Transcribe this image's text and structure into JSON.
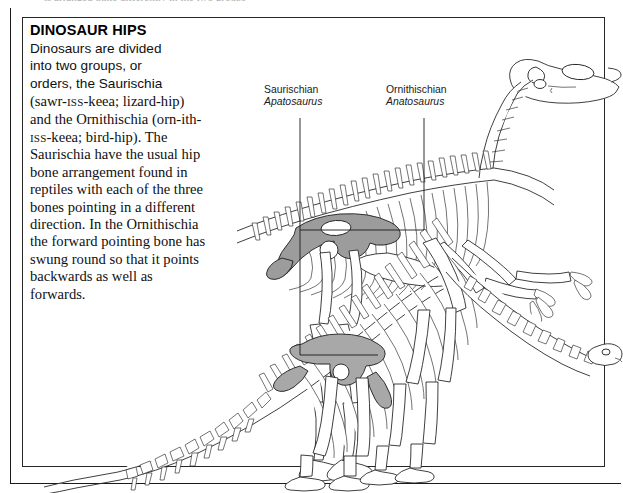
{
  "figure": {
    "clipped_top_line": "is arranged quite differently in the two groups",
    "caption": {
      "title": "DINOSAUR HIPS",
      "sans_lines": [
        "Dinosaurs are divided",
        "into two groups, or",
        "orders, the Saurischia"
      ],
      "serif_paragraph_part1": "(sawr-",
      "serif_smallcaps1": "iss",
      "serif_paragraph_part2": "-keea; lizard-hip) and the Ornithischia (orn-ith-",
      "serif_smallcaps2": "iss",
      "serif_paragraph_part3": "-keea; bird-hip). The Saurischia have the usual hip bone arrangement found in reptiles with each of the three bones pointing in a different direction. In the Ornithischia the forward pointing bone has swung round so that it points backwards as well as forwards."
    },
    "labels": [
      {
        "order": "Saurischian",
        "genus": "Apatosaurus"
      },
      {
        "order": "Ornithischian",
        "genus": "Anatosaurus"
      }
    ],
    "colors": {
      "ink": "#1d1d1d",
      "hip_highlight": "#9c9c9c",
      "paper": "#ffffff"
    }
  }
}
